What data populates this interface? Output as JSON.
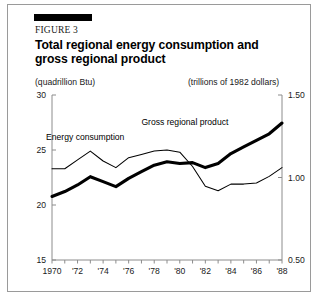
{
  "figure": {
    "number_label": "FIGURE 3",
    "title": "Total regional energy consumption and gross regional product",
    "unit_left": "(quadrillion Btu)",
    "unit_right": "(trillions of 1982 dollars)"
  },
  "chart_data": {
    "type": "line",
    "title": "Total regional energy consumption and gross regional product",
    "xlabel": "",
    "ylabel": "(quadrillion Btu)",
    "y2label": "(trillions of 1982 dollars)",
    "ylim": [
      15,
      30
    ],
    "y2lim": [
      0.5,
      1.5
    ],
    "xlim": [
      1970,
      1988
    ],
    "grid": false,
    "legend": "inline-annotations",
    "y_ticks": [
      "30",
      "25",
      "20",
      "15"
    ],
    "y_tick_values": [
      30,
      25,
      20,
      15
    ],
    "y2_ticks": [
      "1.50",
      "1.00",
      "0.50"
    ],
    "y2_tick_values": [
      1.5,
      1.0,
      0.5
    ],
    "x_ticks": [
      "1970",
      "'72",
      "'74",
      "'76",
      "'78",
      "'80",
      "'82",
      "'84",
      "'86",
      "'88"
    ],
    "x_tick_values": [
      1970,
      1972,
      1974,
      1976,
      1978,
      1980,
      1982,
      1984,
      1986,
      1988
    ],
    "x": [
      1970,
      1971,
      1972,
      1973,
      1974,
      1975,
      1976,
      1977,
      1978,
      1979,
      1980,
      1981,
      1982,
      1983,
      1984,
      1985,
      1986,
      1987,
      1988
    ],
    "series": [
      {
        "name": "Energy consumption",
        "axis": "left",
        "style": "thin",
        "values": [
          23.3,
          23.3,
          24.1,
          24.9,
          24.0,
          23.4,
          24.3,
          24.6,
          24.9,
          25.0,
          24.8,
          23.5,
          21.7,
          21.3,
          21.9,
          21.9,
          22.0,
          22.6,
          23.4
        ]
      },
      {
        "name": "Gross regional product",
        "axis": "right",
        "style": "thick",
        "values": [
          0.885,
          0.915,
          0.955,
          1.005,
          0.975,
          0.945,
          0.995,
          1.035,
          1.075,
          1.095,
          1.085,
          1.09,
          1.06,
          1.085,
          1.145,
          1.185,
          1.225,
          1.265,
          1.33
        ]
      }
    ],
    "annotations": [
      {
        "text": "Energy consumption",
        "x": 1972.6,
        "y": 25.9
      },
      {
        "text": "Gross regional product",
        "x": 1980.4,
        "y": 27.3
      }
    ]
  }
}
